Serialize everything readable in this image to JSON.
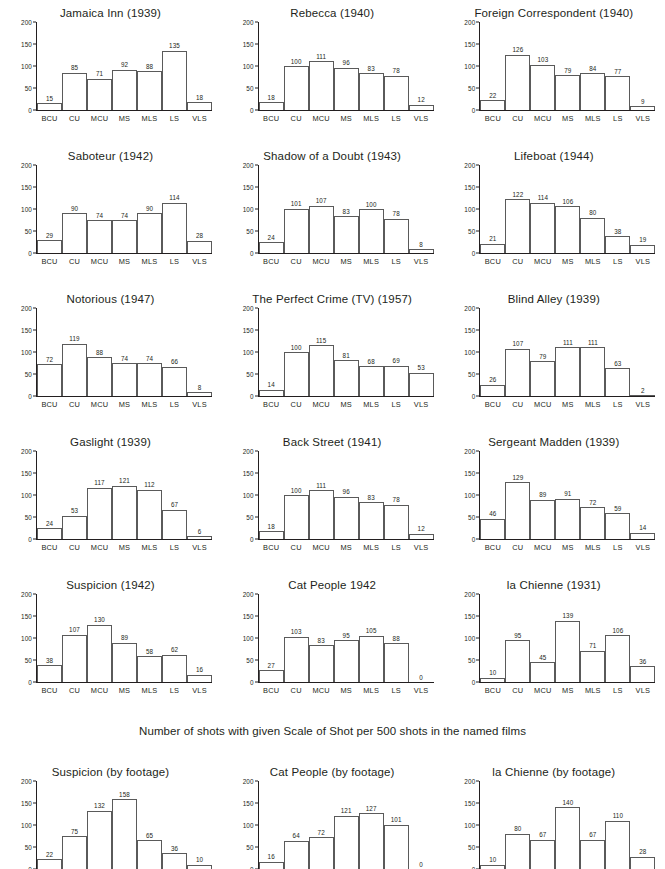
{
  "caption": "Number of shots with given Scale of Shot per 500 shots in the named films",
  "axis": {
    "categories": [
      "BCU",
      "CU",
      "MCU",
      "MS",
      "MLS",
      "LS",
      "VLS"
    ],
    "yticks": [
      0,
      50,
      100,
      150,
      200
    ],
    "ymin": 0,
    "ymax": 200
  },
  "chart_data": [
    {
      "type": "bar",
      "title": "Jamaica Inn (1939)",
      "categories": [
        "BCU",
        "CU",
        "MCU",
        "MS",
        "MLS",
        "LS",
        "VLS"
      ],
      "values": [
        15,
        85,
        71,
        92,
        88,
        135,
        18
      ],
      "xlabel": "",
      "ylabel": "",
      "ylim": [
        0,
        200
      ],
      "grid": false,
      "legend": "none"
    },
    {
      "type": "bar",
      "title": "Rebecca (1940)",
      "categories": [
        "BCU",
        "CU",
        "MCU",
        "MS",
        "MLS",
        "LS",
        "VLS"
      ],
      "values": [
        18,
        100,
        111,
        96,
        83,
        78,
        12
      ],
      "xlabel": "",
      "ylabel": "",
      "ylim": [
        0,
        200
      ],
      "grid": false,
      "legend": "none"
    },
    {
      "type": "bar",
      "title": "Foreign Correspondent (1940)",
      "categories": [
        "BCU",
        "CU",
        "MCU",
        "MS",
        "MLS",
        "LS",
        "VLS"
      ],
      "values": [
        22,
        126,
        103,
        79,
        84,
        77,
        9
      ],
      "xlabel": "",
      "ylabel": "",
      "ylim": [
        0,
        200
      ],
      "grid": false,
      "legend": "none"
    },
    {
      "type": "bar",
      "title": "Saboteur (1942)",
      "categories": [
        "BCU",
        "CU",
        "MCU",
        "MS",
        "MLS",
        "LS",
        "VLS"
      ],
      "values": [
        29,
        90,
        74,
        74,
        90,
        114,
        28
      ],
      "xlabel": "",
      "ylabel": "",
      "ylim": [
        0,
        200
      ],
      "grid": false,
      "legend": "none"
    },
    {
      "type": "bar",
      "title": "Shadow of a Doubt (1943)",
      "categories": [
        "BCU",
        "CU",
        "MCU",
        "MS",
        "MLS",
        "LS",
        "VLS"
      ],
      "values": [
        24,
        101,
        107,
        83,
        100,
        78,
        8
      ],
      "xlabel": "",
      "ylabel": "",
      "ylim": [
        0,
        200
      ],
      "grid": false,
      "legend": "none"
    },
    {
      "type": "bar",
      "title": "Lifeboat (1944)",
      "categories": [
        "BCU",
        "CU",
        "MCU",
        "MS",
        "MLS",
        "LS",
        "VLS"
      ],
      "values": [
        21,
        122,
        114,
        106,
        80,
        38,
        19
      ],
      "xlabel": "",
      "ylabel": "",
      "ylim": [
        0,
        200
      ],
      "grid": false,
      "legend": "none"
    },
    {
      "type": "bar",
      "title": "Notorious (1947)",
      "categories": [
        "BCU",
        "CU",
        "MCU",
        "MS",
        "MLS",
        "LS",
        "VLS"
      ],
      "values": [
        72,
        119,
        88,
        74,
        74,
        66,
        8
      ],
      "xlabel": "",
      "ylabel": "",
      "ylim": [
        0,
        200
      ],
      "grid": false,
      "legend": "none"
    },
    {
      "type": "bar",
      "title": "The Perfect Crime (TV) (1957)",
      "categories": [
        "BCU",
        "CU",
        "MCU",
        "MS",
        "MLS",
        "LS",
        "VLS"
      ],
      "values": [
        14,
        100,
        115,
        81,
        68,
        69,
        53
      ],
      "xlabel": "",
      "ylabel": "",
      "ylim": [
        0,
        200
      ],
      "grid": false,
      "legend": "none"
    },
    {
      "type": "bar",
      "title": "Blind Alley (1939)",
      "categories": [
        "BCU",
        "CU",
        "MCU",
        "MS",
        "MLS",
        "LS",
        "VLS"
      ],
      "values": [
        26,
        107,
        79,
        111,
        111,
        63,
        2
      ],
      "xlabel": "",
      "ylabel": "",
      "ylim": [
        0,
        200
      ],
      "grid": false,
      "legend": "none"
    },
    {
      "type": "bar",
      "title": "Gaslight (1939)",
      "categories": [
        "BCU",
        "CU",
        "MCU",
        "MS",
        "MLS",
        "LS",
        "VLS"
      ],
      "values": [
        24,
        53,
        117,
        121,
        112,
        67,
        6
      ],
      "xlabel": "",
      "ylabel": "",
      "ylim": [
        0,
        200
      ],
      "grid": false,
      "legend": "none"
    },
    {
      "type": "bar",
      "title": "Back Street (1941)",
      "categories": [
        "BCU",
        "CU",
        "MCU",
        "MS",
        "MLS",
        "LS",
        "VLS"
      ],
      "values": [
        18,
        100,
        111,
        96,
        83,
        78,
        12
      ],
      "xlabel": "",
      "ylabel": "",
      "ylim": [
        0,
        200
      ],
      "grid": false,
      "legend": "none"
    },
    {
      "type": "bar",
      "title": "Sergeant Madden (1939)",
      "categories": [
        "BCU",
        "CU",
        "MCU",
        "MS",
        "MLS",
        "LS",
        "VLS"
      ],
      "values": [
        46,
        129,
        89,
        91,
        72,
        59,
        14
      ],
      "xlabel": "",
      "ylabel": "",
      "ylim": [
        0,
        200
      ],
      "grid": false,
      "legend": "none"
    },
    {
      "type": "bar",
      "title": "Suspicion (1942)",
      "categories": [
        "BCU",
        "CU",
        "MCU",
        "MS",
        "MLS",
        "LS",
        "VLS"
      ],
      "values": [
        38,
        107,
        130,
        89,
        58,
        62,
        16
      ],
      "xlabel": "",
      "ylabel": "",
      "ylim": [
        0,
        200
      ],
      "grid": false,
      "legend": "none"
    },
    {
      "type": "bar",
      "title": "Cat People 1942",
      "categories": [
        "BCU",
        "CU",
        "MCU",
        "MS",
        "MLS",
        "LS",
        "VLS"
      ],
      "values": [
        27,
        103,
        83,
        95,
        105,
        88,
        0
      ],
      "xlabel": "",
      "ylabel": "",
      "ylim": [
        0,
        200
      ],
      "grid": false,
      "legend": "none"
    },
    {
      "type": "bar",
      "title": "la Chienne (1931)",
      "categories": [
        "BCU",
        "CU",
        "MCU",
        "MS",
        "MLS",
        "LS",
        "VLS"
      ],
      "values": [
        10,
        95,
        45,
        139,
        71,
        106,
        36
      ],
      "xlabel": "",
      "ylabel": "",
      "ylim": [
        0,
        200
      ],
      "grid": false,
      "legend": "none"
    },
    {
      "type": "bar",
      "title": "Suspicion (by footage)",
      "categories": [
        "BCU",
        "CU",
        "MCU",
        "MS",
        "MLS",
        "LS",
        "VLS"
      ],
      "values": [
        22,
        75,
        132,
        158,
        65,
        36,
        10
      ],
      "xlabel": "",
      "ylabel": "",
      "ylim": [
        0,
        200
      ],
      "grid": false,
      "legend": "none"
    },
    {
      "type": "bar",
      "title": "Cat People (by footage)",
      "categories": [
        "BCU",
        "CU",
        "MCU",
        "MS",
        "MLS",
        "LS",
        "VLS"
      ],
      "values": [
        16,
        64,
        72,
        121,
        127,
        101,
        0
      ],
      "xlabel": "",
      "ylabel": "",
      "ylim": [
        0,
        200
      ],
      "grid": false,
      "legend": "none"
    },
    {
      "type": "bar",
      "title": "la Chienne (by footage)",
      "categories": [
        "BCU",
        "CU",
        "MCU",
        "MS",
        "MLS",
        "LS",
        "VLS"
      ],
      "values": [
        10,
        80,
        67,
        140,
        67,
        110,
        28
      ],
      "xlabel": "",
      "ylabel": "",
      "ylim": [
        0,
        200
      ],
      "grid": false,
      "legend": "none"
    }
  ]
}
